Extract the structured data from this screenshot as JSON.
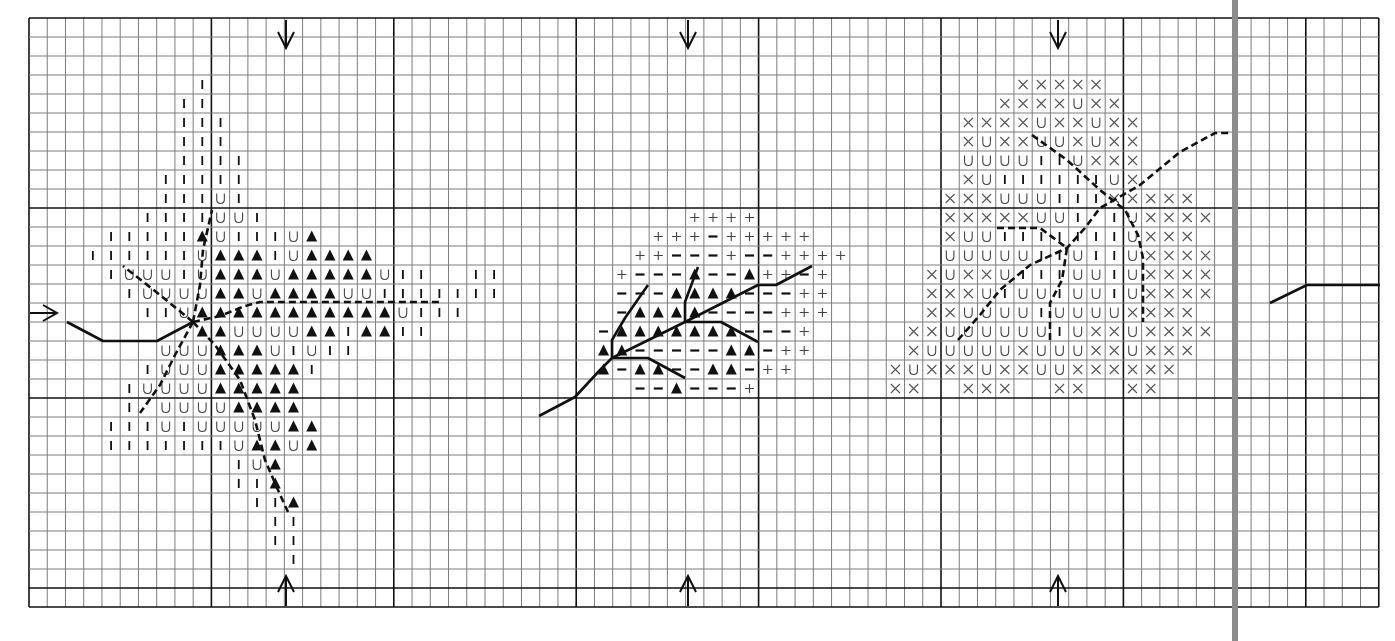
{
  "chart_data": {
    "type": "table",
    "title": "",
    "grid": {
      "cols": 74,
      "rows": 31,
      "major_every": 10,
      "origin_px": [
        29,
        18
      ],
      "cell_w": 18.24,
      "cell_h": 19.0,
      "major_cols": [
        10,
        20,
        30,
        40,
        50,
        60,
        70
      ],
      "major_rows": [
        10,
        20,
        30
      ],
      "minor_color": "#7a7a7a",
      "major_color": "#111111"
    },
    "legend_symbols": {
      "I": "vertical-bar",
      "U": "u-shape",
      "T": "filled-triangle",
      "P": "plus",
      "M": "minus",
      "X": "cross"
    },
    "arrows": [
      {
        "dir": "down",
        "x": 286,
        "y": 20
      },
      {
        "dir": "down",
        "x": 688,
        "y": 20
      },
      {
        "dir": "down",
        "x": 1058,
        "y": 20
      },
      {
        "dir": "up",
        "x": 286,
        "y": 606
      },
      {
        "dir": "up",
        "x": 688,
        "y": 606
      },
      {
        "dir": "up",
        "x": 1058,
        "y": 606
      },
      {
        "dir": "right",
        "x": 30,
        "y": 313
      }
    ],
    "center_markers": [
      {
        "label": "center-top",
        "col_px": [
          286,
          688,
          1058
        ]
      },
      {
        "label": "center-left",
        "row_px": 313
      }
    ],
    "separator": {
      "x": 1235,
      "color": "#8a8a8a"
    },
    "motifs": [
      {
        "name": "motif-1-star",
        "rows": [
          {
            "r": 3,
            "c": 9,
            "s": "I"
          },
          {
            "r": 4,
            "c": 8,
            "s": "II"
          },
          {
            "r": 5,
            "c": 8,
            "s": "III"
          },
          {
            "r": 6,
            "c": 8,
            "s": "III"
          },
          {
            "r": 7,
            "c": 8,
            "s": "IIII"
          },
          {
            "r": 8,
            "c": 7,
            "s": "IIIII"
          },
          {
            "r": 9,
            "c": 7,
            "s": "IIIUI"
          },
          {
            "r": 10,
            "c": 6,
            "s": "IIIIUUI"
          },
          {
            "r": 11,
            "c": 4,
            "s": "IIIIITUIIIUT"
          },
          {
            "r": 12,
            "c": 3,
            "s": "IIIIIIUTTTIUTTTT"
          },
          {
            "r": 13,
            "c": 4,
            "s": "IUUUIUTTTUTTTTTUII  II"
          },
          {
            "r": 14,
            "c": 5,
            "s": "IUUUUTTUTTTTUUIIIIIII"
          },
          {
            "r": 15,
            "c": 6,
            "s": "IIUTTTTTTTTTTTUIII"
          },
          {
            "r": 16,
            "c": 9,
            "s": "TTUUUUTTITTII"
          },
          {
            "r": 17,
            "c": 7,
            "s": "UUUTTTUIUII"
          },
          {
            "r": 18,
            "c": 6,
            "s": "IUUUTTTTTI"
          },
          {
            "r": 19,
            "c": 5,
            "s": "IUUUUTTTTT"
          },
          {
            "r": 20,
            "c": 5,
            "s": "I UUUUTTTT"
          },
          {
            "r": 21,
            "c": 4,
            "s": "IIIUIUUUUUTT"
          },
          {
            "r": 22,
            "c": 4,
            "s": "IIIIIIIUTTUT"
          },
          {
            "r": 23,
            "c": 11,
            "s": "IUT"
          },
          {
            "r": 24,
            "c": 11,
            "s": "IIT"
          },
          {
            "r": 25,
            "c": 12,
            "s": "IIT"
          },
          {
            "r": 26,
            "c": 13,
            "s": "II"
          },
          {
            "r": 27,
            "c": 13,
            "s": "II"
          },
          {
            "r": 28,
            "c": 14,
            "s": "I"
          }
        ],
        "solid_lines": [
          [
            [
              67,
              322
            ],
            [
              103,
              341
            ],
            [
              157,
              341
            ],
            [
              193,
              322
            ]
          ]
        ],
        "dashed_lines": [
          [
            [
              193,
              322
            ],
            [
              200,
              285
            ],
            [
              203,
              250
            ],
            [
              212,
              210
            ]
          ],
          [
            [
              193,
              322
            ],
            [
              160,
              295
            ],
            [
              123,
              266
            ]
          ],
          [
            [
              193,
              322
            ],
            [
              175,
              355
            ],
            [
              160,
              385
            ],
            [
              140,
              413
            ]
          ],
          [
            [
              193,
              322
            ],
            [
              215,
              345
            ],
            [
              240,
              380
            ],
            [
              255,
              420
            ],
            [
              265,
              460
            ],
            [
              278,
              490
            ],
            [
              288,
              512
            ]
          ],
          [
            [
              193,
              322
            ],
            [
              220,
              316
            ],
            [
              245,
              306
            ],
            [
              260,
              302
            ],
            [
              440,
              302
            ]
          ]
        ]
      },
      {
        "name": "motif-2-branch",
        "rows": [
          {
            "r": 10,
            "c": 36,
            "s": "PPPP"
          },
          {
            "r": 11,
            "c": 34,
            "s": "PPPMPPPPP"
          },
          {
            "r": 12,
            "c": 33,
            "s": "PPMMMPMMPPPP"
          },
          {
            "r": 13,
            "c": 32,
            "s": "PMMMTMMTPPMP"
          },
          {
            "r": 14,
            "c": 32,
            "s": "MMMTTTTMMMPP"
          },
          {
            "r": 15,
            "c": 32,
            "s": "MTTTTMMMMPPP"
          },
          {
            "r": 16,
            "c": 31,
            "s": "MTTTTTTTMMMP"
          },
          {
            "r": 17,
            "c": 31,
            "s": "TTMMMMMTTMPP"
          },
          {
            "r": 18,
            "c": 31,
            "s": "TMTTMMTTMPP"
          },
          {
            "r": 19,
            "c": 33,
            "s": "MMTMMMP"
          }
        ],
        "solid_lines": [
          [
            [
              539,
              416
            ],
            [
              575,
              397
            ],
            [
              600,
              370
            ],
            [
              612,
              358
            ],
            [
              685,
              322
            ],
            [
              758,
              285
            ],
            [
              776,
              285
            ],
            [
              812,
              266
            ]
          ],
          [
            [
              612,
              358
            ],
            [
              612,
              340
            ],
            [
              625,
              318
            ],
            [
              648,
              285
            ]
          ],
          [
            [
              612,
              358
            ],
            [
              648,
              358
            ],
            [
              685,
              378
            ]
          ],
          [
            [
              685,
              322
            ],
            [
              685,
              302
            ],
            [
              698,
              267
            ]
          ],
          [
            [
              685,
              322
            ],
            [
              721,
              322
            ],
            [
              758,
              342
            ]
          ]
        ],
        "dashed_lines": []
      },
      {
        "name": "motif-3-flower",
        "rows": [
          {
            "r": 3,
            "c": 54,
            "s": "XXXXX"
          },
          {
            "r": 4,
            "c": 53,
            "s": "XXXXUXX"
          },
          {
            "r": 5,
            "c": 51,
            "s": "XXXXUXXUXX"
          },
          {
            "r": 6,
            "c": 51,
            "s": "XUXXUUXUXX"
          },
          {
            "r": 7,
            "c": 51,
            "s": "UUUUIIUXXX"
          },
          {
            "r": 8,
            "c": 51,
            "s": "XUIIIIIIUX"
          },
          {
            "r": 9,
            "c": 50,
            "s": "XXXUUUIIIXXXXX"
          },
          {
            "r": 10,
            "c": 50,
            "s": "XXXXXUUI IUXXXX"
          },
          {
            "r": 11,
            "c": 50,
            "s": "XUUIIIIIIIUXXX"
          },
          {
            "r": 12,
            "c": 50,
            "s": "UUUUUIIUIIUXXXX"
          },
          {
            "r": 13,
            "c": 49,
            "s": "XUXXUIIIUUIUXXXX"
          },
          {
            "r": 14,
            "c": 49,
            "s": "XXXUIUUIUUIUXXXX"
          },
          {
            "r": 15,
            "c": 49,
            "s": "XXUUUUIUUUUXXXX"
          },
          {
            "r": 16,
            "c": 48,
            "s": "XXUUUUUUIUXXUXXXX"
          },
          {
            "r": 17,
            "c": 48,
            "s": "XUUUUUXUUUXXUXXX"
          },
          {
            "r": 18,
            "c": 47,
            "s": "XUXXXUXXUUXXXXXX"
          },
          {
            "r": 19,
            "c": 47,
            "s": "XX  XXX  XX  XX"
          }
        ],
        "solid_lines": [],
        "dashed_lines": [
          [
            [
              958,
              340
            ],
            [
              980,
              315
            ],
            [
              1000,
              290
            ],
            [
              1030,
              265
            ],
            [
              1067,
              248
            ],
            [
              1085,
              228
            ],
            [
              1100,
              208
            ],
            [
              1140,
              185
            ],
            [
              1180,
              152
            ],
            [
              1215,
              133
            ],
            [
              1232,
              133
            ]
          ],
          [
            [
              1032,
              135
            ],
            [
              1067,
              160
            ],
            [
              1100,
              190
            ],
            [
              1125,
              210
            ],
            [
              1138,
              235
            ],
            [
              1143,
              258
            ],
            [
              1143,
              322
            ]
          ],
          [
            [
              997,
              228
            ],
            [
              1040,
              228
            ],
            [
              1067,
              248
            ],
            [
              1062,
              280
            ],
            [
              1050,
              303
            ],
            [
              1050,
              340
            ]
          ]
        ]
      },
      {
        "name": "motif-4-edge",
        "rows": [],
        "solid_lines": [
          [
            [
              1270,
              303
            ],
            [
              1307,
              285
            ],
            [
              1380,
              285
            ]
          ]
        ],
        "dashed_lines": []
      }
    ]
  },
  "colors": {
    "background": "#ffffff",
    "ink": "#111111",
    "grid_minor": "#7d7d7d",
    "grid_major": "#111111",
    "separator": "#8c8c8c"
  }
}
